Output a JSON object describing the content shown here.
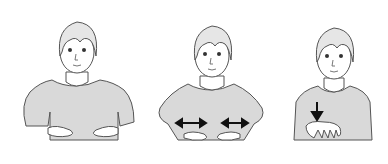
{
  "figure": {
    "colors": {
      "background": "#ffffff",
      "line": "#555555",
      "shirt": "#d9d9d9",
      "skin": "#ffffff",
      "arrow": "#111111"
    },
    "panels": [
      {
        "step": 1,
        "pose": "both-hands-palms-up-at-waist",
        "arrow": "none"
      },
      {
        "step": 2,
        "pose": "both-hands-at-waist-moving-sideways",
        "arrow": "double-headed-horizontal-both-hands"
      },
      {
        "step": 3,
        "pose": "one-hand-palm-down-at-chest",
        "arrow": "down"
      }
    ]
  }
}
